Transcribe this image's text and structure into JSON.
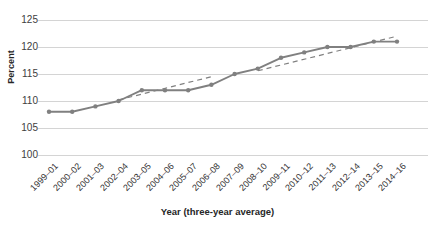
{
  "chart_data": {
    "type": "line",
    "title": "",
    "xlabel": "Year (three-year average)",
    "ylabel": "Percent",
    "ylim": [
      100,
      125
    ],
    "yticks": [
      100,
      105,
      110,
      115,
      120,
      125
    ],
    "grid": true,
    "legend": "none",
    "categories": [
      "1999–01",
      "2000–02",
      "2001–03",
      "2002–04",
      "2003–05",
      "2004–06",
      "2005–07",
      "2006–08",
      "2007–09",
      "2008–10",
      "2009–11",
      "2010–12",
      "2011–13",
      "2012–14",
      "2013–15",
      "2014–16"
    ],
    "series": [
      {
        "name": "Percent",
        "style": "solid-with-markers",
        "color": "#808080",
        "values": [
          108,
          108,
          109,
          110,
          112,
          112,
          112,
          113,
          115,
          116,
          118,
          119,
          120,
          120,
          121,
          121
        ]
      },
      {
        "name": "Trend segment 1",
        "style": "dashed",
        "color": "#808080",
        "x_range": [
          "2002–04",
          "2006–08"
        ],
        "y_range": [
          110.2,
          114.5
        ]
      },
      {
        "name": "Trend segment 2",
        "style": "dashed",
        "color": "#808080",
        "x_range": [
          "2008–10",
          "2014–16"
        ],
        "y_range": [
          115.6,
          122.0
        ]
      }
    ]
  },
  "axis": {
    "y_title": "Percent",
    "x_title": "Year (three-year average)",
    "y_tick_labels": [
      "125",
      "120",
      "115",
      "110",
      "105",
      "100"
    ]
  },
  "colors": {
    "line": "#808080",
    "marker": "#808080",
    "grid": "#d4d4d4",
    "text": "#333333",
    "background": "#ffffff"
  }
}
